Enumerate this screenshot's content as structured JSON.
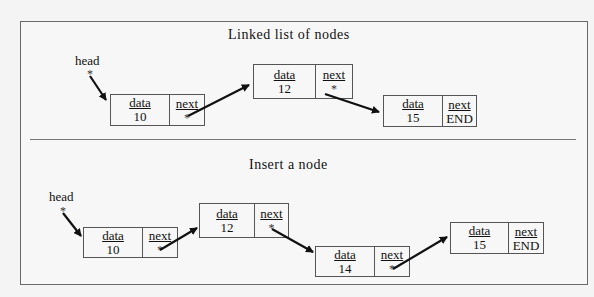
{
  "diagram": {
    "top": {
      "title": "Linked list of nodes",
      "head_label": "head",
      "head_pointer": "*",
      "nodes": [
        {
          "data_label": "data",
          "next_label": "next",
          "value": "10",
          "next": "*"
        },
        {
          "data_label": "data",
          "next_label": "next",
          "value": "12",
          "next": "*"
        },
        {
          "data_label": "data",
          "next_label": "next",
          "value": "15",
          "next": "END"
        }
      ]
    },
    "bottom": {
      "title": "Insert a node",
      "head_label": "head",
      "head_pointer": "*",
      "nodes": [
        {
          "data_label": "data",
          "next_label": "next",
          "value": "10",
          "next": "*"
        },
        {
          "data_label": "data",
          "next_label": "next",
          "value": "12",
          "next": "*"
        },
        {
          "data_label": "data",
          "next_label": "next",
          "value": "14",
          "next": "*"
        },
        {
          "data_label": "data",
          "next_label": "next",
          "value": "15",
          "next": "END"
        }
      ]
    },
    "colors": {
      "line": "#555555",
      "arrow": "#111111",
      "background": "#f4f4f4"
    }
  }
}
